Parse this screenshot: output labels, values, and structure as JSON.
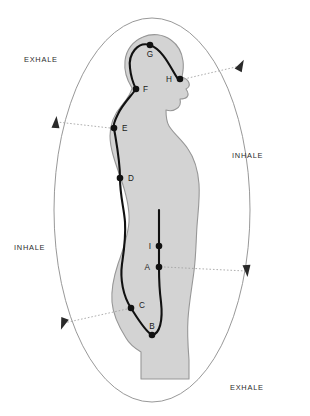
{
  "figure": {
    "background_color": "#ffffff",
    "body_fill": "#d2d2d2",
    "body_outline_color": "#8f8f8f",
    "wave_line_color": "#111111",
    "ellipse_color": "#8c8c8c",
    "leader_line_color": "#9a9a9a",
    "point_color": "#111111"
  },
  "cycle_labels": [
    {
      "id": "exhale-top-left",
      "text": "EXHALE",
      "x": 24,
      "y": 62
    },
    {
      "id": "inhale-right",
      "text": "INHALE",
      "x": 232,
      "y": 158
    },
    {
      "id": "inhale-bottom-left",
      "text": "INHALE",
      "x": 14,
      "y": 250
    },
    {
      "id": "exhale-bottom-right",
      "text": "EXHALE",
      "x": 230,
      "y": 390
    }
  ],
  "points": [
    {
      "label": "A",
      "x": 159,
      "y": 267,
      "label_x": 150,
      "label_y": 270,
      "anchor": "end"
    },
    {
      "label": "B",
      "x": 152,
      "y": 335,
      "label_x": 152,
      "label_y": 329,
      "anchor": "middle"
    },
    {
      "label": "C",
      "x": 131,
      "y": 308,
      "label_x": 139,
      "label_y": 308,
      "anchor": "start"
    },
    {
      "label": "D",
      "x": 120,
      "y": 178,
      "label_x": 128,
      "label_y": 181,
      "anchor": "start"
    },
    {
      "label": "E",
      "x": 114,
      "y": 128,
      "label_x": 122,
      "label_y": 131,
      "anchor": "start"
    },
    {
      "label": "F",
      "x": 136,
      "y": 89,
      "label_x": 143,
      "label_y": 92,
      "anchor": "start"
    },
    {
      "label": "G",
      "x": 150,
      "y": 45,
      "label_x": 150,
      "label_y": 57,
      "anchor": "middle"
    },
    {
      "label": "H",
      "x": 180,
      "y": 79,
      "label_x": 172,
      "label_y": 82,
      "anchor": "end"
    },
    {
      "label": "I",
      "x": 159,
      "y": 246,
      "label_x": 151,
      "label_y": 249,
      "anchor": "end"
    }
  ],
  "leaders": [
    {
      "id": "leader-h-to-upper-right",
      "from_point": "H",
      "x1": 184,
      "y1": 79,
      "x2": 240,
      "y2": 66
    },
    {
      "id": "leader-e-to-upper-left",
      "from_point": "E",
      "x1": 110,
      "y1": 128,
      "x2": 57,
      "y2": 122
    },
    {
      "id": "leader-a-to-lower-right",
      "from_point": "A",
      "x1": 164,
      "y1": 267,
      "x2": 246,
      "y2": 271
    },
    {
      "id": "leader-c-to-lower-left",
      "from_point": "C",
      "x1": 127,
      "y1": 309,
      "x2": 64,
      "y2": 323
    }
  ],
  "arrowheads": [
    {
      "id": "arrow-upper-right",
      "x": 241,
      "y": 65,
      "rotation": 28,
      "direction": "up-right"
    },
    {
      "id": "arrow-upper-left",
      "x": 56,
      "y": 122,
      "rotation": 5,
      "direction": "up"
    },
    {
      "id": "arrow-lower-right",
      "x": 247,
      "y": 271,
      "rotation": 175,
      "direction": "down"
    },
    {
      "id": "arrow-lower-left",
      "x": 63,
      "y": 324,
      "rotation": 200,
      "direction": "down-left"
    }
  ],
  "ellipse": {
    "cx": 152,
    "cy": 210,
    "rx": 98,
    "ry": 192,
    "note": "outer breath-cycle loop, vertical oval"
  },
  "caption": ""
}
